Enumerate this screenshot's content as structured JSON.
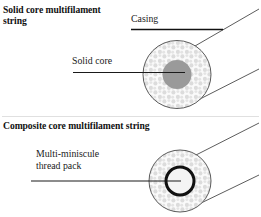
{
  "diagram": {
    "type": "technical-cross-section",
    "sections": [
      {
        "id": "solid-core",
        "title": "Solid core multifilament\nstring",
        "labels": [
          {
            "id": "casing",
            "text": "Casing"
          },
          {
            "id": "solid-core",
            "text": "Solid core"
          }
        ]
      },
      {
        "id": "composite-core",
        "title": "Composite core multifilament string",
        "labels": [
          {
            "id": "thread-pack",
            "text": "Multi-miniscule\nthread pack"
          }
        ]
      }
    ]
  },
  "colors": {
    "stroke": "#3c3c3c",
    "leader": "#1a1a1a",
    "speckle_fill": "#d8d8d8",
    "speckle_bg": "#fafafa",
    "solid_core_fill": "#9a9a9a",
    "ring_stroke": "#111111",
    "ring_fill": "#f4f4f4",
    "divider": "#cfcfcf",
    "text": "#111111"
  },
  "geometry": {
    "top_circle": {
      "cx": 177,
      "cy": 74.5,
      "r": 34
    },
    "top_core": {
      "cx": 177,
      "cy": 74.5,
      "r": 14.5
    },
    "bottom_circle": {
      "cx": 180,
      "cy": 181,
      "r": 31
    },
    "bottom_ring": {
      "cx": 180,
      "cy": 181,
      "r": 14,
      "stroke_width": 3
    }
  }
}
